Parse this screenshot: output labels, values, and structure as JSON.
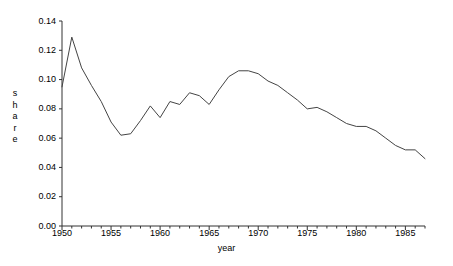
{
  "chart_data": {
    "type": "line",
    "title": "",
    "xlabel": "year",
    "ylabel": "share",
    "ylabel_letters": [
      "s",
      "h",
      "a",
      "r",
      "e"
    ],
    "xlim": [
      1950,
      1987
    ],
    "ylim": [
      0.0,
      0.14
    ],
    "grid": false,
    "legend": null,
    "line_color": "#444444",
    "axis_color": "#333333",
    "y_ticks": [
      {
        "value": 0.0,
        "label": "0.00"
      },
      {
        "value": 0.02,
        "label": "0.02"
      },
      {
        "value": 0.04,
        "label": "0.04"
      },
      {
        "value": 0.06,
        "label": "0.06"
      },
      {
        "value": 0.08,
        "label": "0.08"
      },
      {
        "value": 0.1,
        "label": "0.10"
      },
      {
        "value": 0.12,
        "label": "0.12"
      },
      {
        "value": 0.14,
        "label": "0.14"
      }
    ],
    "x_major_ticks": [
      {
        "value": 1950,
        "label": "1950"
      },
      {
        "value": 1955,
        "label": "1955"
      },
      {
        "value": 1960,
        "label": "1960"
      },
      {
        "value": 1965,
        "label": "1965"
      },
      {
        "value": 1970,
        "label": "1970"
      },
      {
        "value": 1975,
        "label": "1975"
      },
      {
        "value": 1980,
        "label": "1980"
      },
      {
        "value": 1985,
        "label": "1985"
      }
    ],
    "x_minor_tick_step": 1,
    "x": [
      1950,
      1951,
      1952,
      1953,
      1954,
      1955,
      1956,
      1957,
      1958,
      1959,
      1960,
      1961,
      1962,
      1963,
      1964,
      1965,
      1966,
      1967,
      1968,
      1969,
      1970,
      1971,
      1972,
      1973,
      1974,
      1975,
      1976,
      1977,
      1978,
      1979,
      1980,
      1981,
      1982,
      1983,
      1984,
      1985,
      1986,
      1987
    ],
    "values": [
      0.095,
      0.129,
      0.108,
      0.096,
      0.085,
      0.071,
      0.062,
      0.063,
      0.072,
      0.082,
      0.074,
      0.085,
      0.083,
      0.091,
      0.089,
      0.083,
      0.093,
      0.102,
      0.106,
      0.106,
      0.104,
      0.099,
      0.096,
      0.091,
      0.086,
      0.08,
      0.081,
      0.078,
      0.074,
      0.07,
      0.068,
      0.068,
      0.065,
      0.06,
      0.055,
      0.052,
      0.052,
      0.046
    ],
    "series": [
      {
        "name": "share",
        "values": [
          0.095,
          0.129,
          0.108,
          0.096,
          0.085,
          0.071,
          0.062,
          0.063,
          0.072,
          0.082,
          0.074,
          0.085,
          0.083,
          0.091,
          0.089,
          0.083,
          0.093,
          0.102,
          0.106,
          0.106,
          0.104,
          0.099,
          0.096,
          0.091,
          0.086,
          0.08,
          0.081,
          0.078,
          0.074,
          0.07,
          0.068,
          0.068,
          0.065,
          0.06,
          0.055,
          0.052,
          0.052,
          0.046
        ]
      }
    ]
  }
}
